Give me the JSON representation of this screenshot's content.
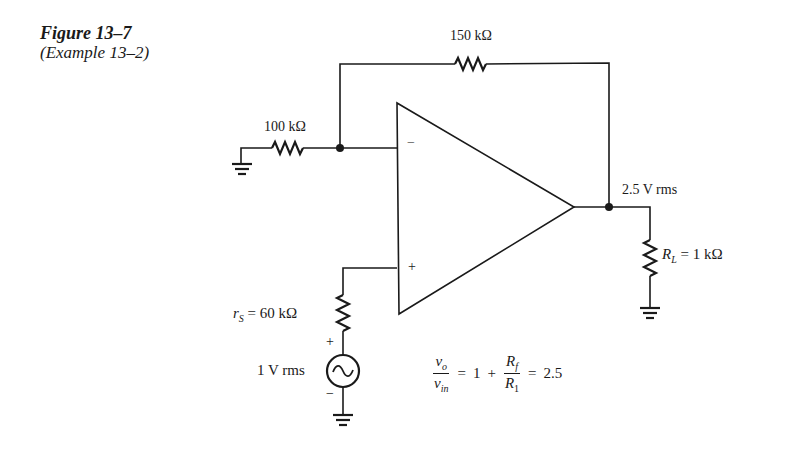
{
  "figure": {
    "title": "Figure 13–7",
    "subtitle": "(Example 13–2)"
  },
  "components": {
    "feedback_resistor": {
      "label": "150 kΩ"
    },
    "input_resistor": {
      "label": "100 kΩ"
    },
    "source_resistor": {
      "symbol": "r",
      "subscript": "S",
      "value": "= 60 kΩ"
    },
    "load_resistor": {
      "symbol": "R",
      "subscript": "L",
      "value": "= 1 kΩ"
    },
    "source": {
      "label": "1 V rms",
      "plus": "+",
      "minus": "−"
    },
    "output": {
      "label": "2.5 V rms"
    },
    "opamp": {
      "inverting": "−",
      "noninverting": "+"
    }
  },
  "equation": {
    "lhs_num": "vo",
    "lhs_num_main": "v",
    "lhs_num_sub": "o",
    "lhs_den_main": "v",
    "lhs_den_sub": "in",
    "eq1": "=",
    "one": "1",
    "plus": "+",
    "rhs_num_main": "R",
    "rhs_num_sub": "f",
    "rhs_den_main": "R",
    "rhs_den_sub": "1",
    "eq2": "=",
    "result": "2.5"
  }
}
